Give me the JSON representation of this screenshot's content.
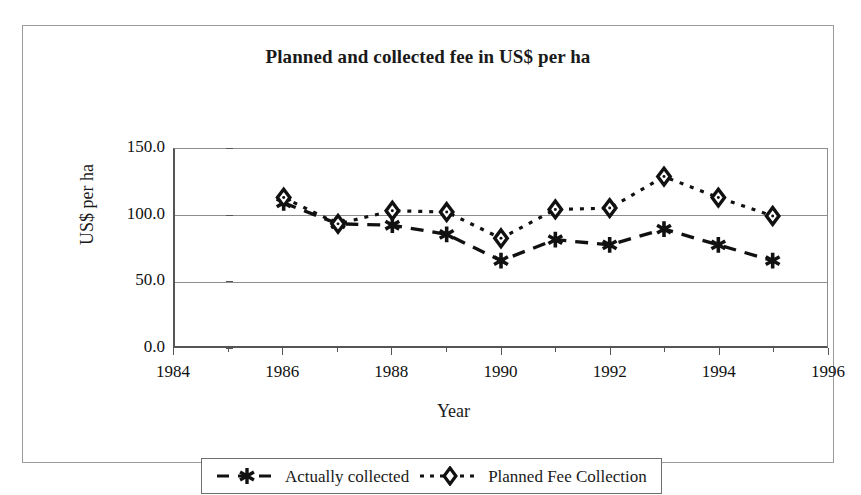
{
  "chart_data": {
    "type": "line",
    "title": "Planned and collected fee in US$ per ha",
    "xlabel": "Year",
    "ylabel": "US$ per ha",
    "x": [
      1986,
      1987,
      1988,
      1989,
      1990,
      1991,
      1992,
      1993,
      1994,
      1995
    ],
    "series": [
      {
        "name": "Actually collected",
        "marker": "asterisk",
        "linestyle": "dashed",
        "color": "#111111",
        "values": [
          109,
          93,
          92,
          85,
          65,
          81,
          77,
          89,
          77,
          65
        ]
      },
      {
        "name": "Planned Fee Collection",
        "marker": "diamond",
        "linestyle": "dotted",
        "color": "#111111",
        "values": [
          113,
          93,
          103,
          102,
          82,
          104,
          105,
          129,
          113,
          99
        ]
      }
    ],
    "xlim": [
      1984,
      1996
    ],
    "ylim": [
      0.0,
      150.0
    ],
    "yticks": [
      "0.0",
      "50.0",
      "100.0",
      "150.0"
    ],
    "ytick_values": [
      0,
      50,
      100,
      150
    ],
    "xticks": [
      "1984",
      "1986",
      "1988",
      "1990",
      "1992",
      "1994",
      "1996"
    ],
    "xtick_values": [
      1984,
      1986,
      1988,
      1990,
      1992,
      1994,
      1996
    ],
    "grid": true,
    "legend_position": "bottom"
  },
  "legend": {
    "entries": [
      {
        "label": "Actually collected",
        "marker": "asterisk-marker",
        "dash": "dashed"
      },
      {
        "label": "Planned Fee Collection",
        "marker": "diamond-marker",
        "dash": "dotted"
      }
    ]
  },
  "colors": {
    "ink": "#111111",
    "axis": "#555555",
    "grid": "#8d8d8d",
    "frame": "#9a9a9a",
    "background": "#ffffff"
  }
}
